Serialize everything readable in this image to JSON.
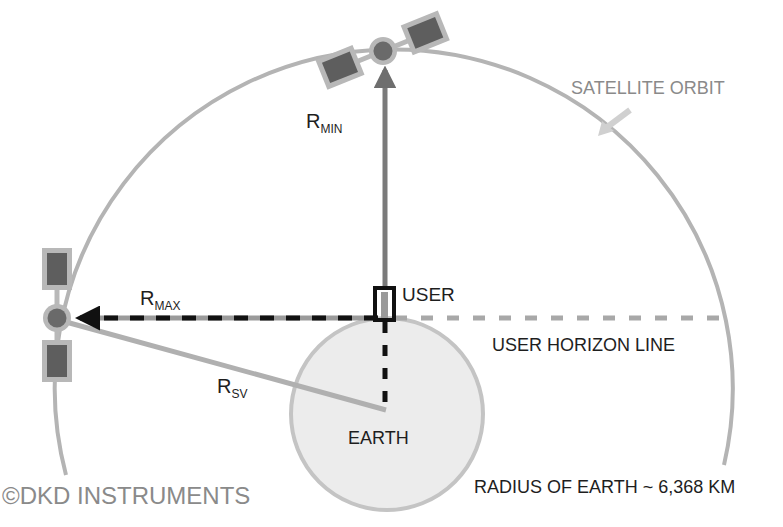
{
  "diagram": {
    "colors": {
      "background": "#ffffff",
      "orbit": "#b4b4b4",
      "earth_fill": "#ececec",
      "earth_stroke": "#c4c4c4",
      "satellite_body": "#6a6a6a",
      "satellite_panel": "#5e5e5e",
      "satellite_frame": "#b8b8b8",
      "rmin_line": "#7a7a7a",
      "rmax_line": "#111111",
      "rsv_line": "#b0b0b0",
      "horizon_line": "#a8a8a8",
      "text_dark": "#1e1e1e",
      "text_gray": "#8a8a8a"
    },
    "labels": {
      "satellite_orbit": "SATELLITE ORBIT",
      "rmin_main": "R",
      "rmin_sub": "MIN",
      "rmax_main": "R",
      "rmax_sub": "MAX",
      "rsv_main": "R",
      "rsv_sub": "SV",
      "user": "USER",
      "user_horizon_line": "USER HORIZON LINE",
      "earth": "EARTH",
      "radius_of_earth": "RADIUS OF EARTH ~ 6,368 KM",
      "copyright_symbol": "©",
      "copyright_owner": "DKD INSTRUMENTS"
    },
    "geometry": {
      "orbit_center": [
        388,
        397
      ],
      "orbit_radius": 339,
      "earth_center": [
        387,
        414
      ],
      "earth_radius": 96,
      "user_position": [
        385,
        318
      ],
      "satellite_top": [
        383,
        51
      ],
      "satellite_left": [
        57,
        318
      ]
    }
  }
}
